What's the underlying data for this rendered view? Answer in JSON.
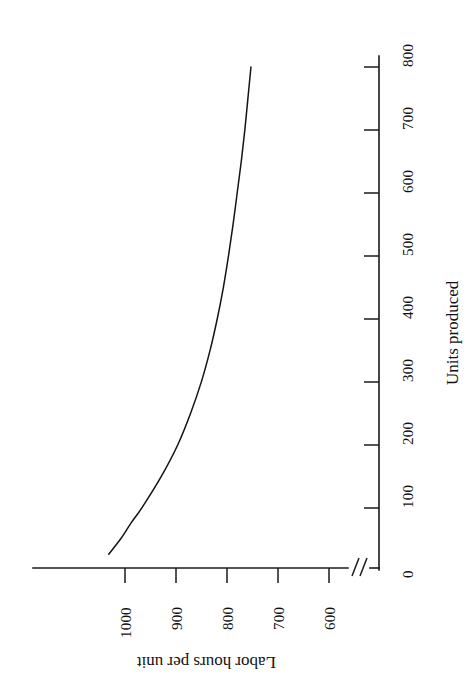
{
  "chart_data": {
    "type": "line",
    "title": "",
    "subtitle": "",
    "xlabel": "Units produced",
    "ylabel": "Labor hours per unit",
    "xlim": [
      0,
      860
    ],
    "ylim": [
      560,
      1060
    ],
    "xticks": [
      0,
      100,
      200,
      300,
      400,
      500,
      600,
      700,
      800
    ],
    "xtick_labels": [
      "0",
      "100",
      "200",
      "300",
      "400",
      "500",
      "600",
      "700",
      "800"
    ],
    "yticks": [
      600,
      700,
      800,
      900,
      1000
    ],
    "ytick_labels": [
      "600",
      "700",
      "800",
      "900",
      "1000"
    ],
    "grid": false,
    "legend": "none",
    "axis_break": {
      "axis": "y",
      "between": [
        0,
        560
      ],
      "glyph": "//"
    },
    "orientation_note": "chart drawn rotated 90 degrees clockwise on the page",
    "series": [
      {
        "name": "Learning curve",
        "color": "#141414",
        "x": [
          25,
          50,
          75,
          100,
          150,
          200,
          250,
          300,
          350,
          400,
          450,
          500,
          550,
          600,
          650,
          700,
          750,
          800
        ],
        "y": [
          1032,
          1008,
          988,
          966,
          928,
          896,
          871,
          850,
          833,
          819,
          807,
          797,
          788,
          780,
          772,
          765,
          759,
          753
        ]
      }
    ]
  },
  "axes": {
    "x_axis_name": "Units produced",
    "y_axis_name": "Labor hours per unit"
  },
  "marks": {
    "break_glyph": "//",
    "corner_speck": ""
  }
}
